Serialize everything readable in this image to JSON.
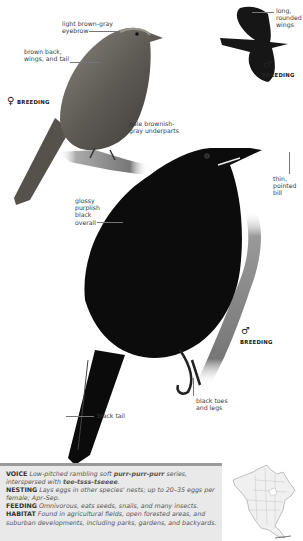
{
  "female": {
    "sex_symbol": "♀",
    "plumage": "BREEDING",
    "labels": {
      "eyebrow": "light brown-gray\neyebrow",
      "back": "brown back,\nwings, and tail",
      "underparts": "pale brownish-\ngray underparts"
    }
  },
  "flying_male": {
    "sex_symbol": "♂",
    "plumage": "BREEDING",
    "labels": {
      "wings": "long,\nrounded\nwings"
    }
  },
  "male": {
    "sex_symbol": "♂",
    "plumage": "BREEDING",
    "labels": {
      "overall": "glossy\npurplish\nblack\noverall",
      "bill": "thin,\npointed\nbill",
      "toes": "black toes\nand legs",
      "tail": "black tail"
    }
  },
  "info": {
    "voice_key": "VOICE",
    "voice_text_1": "Low-pitched rambling soft ",
    "voice_call": "purr-purr-purr",
    "voice_text_2": " series,\ninterspersed with ",
    "voice_call_2": "tee-tsss-tseeee",
    "voice_text_3": ".",
    "nesting_key": "NESTING",
    "nesting_text": "Lays eggs in other species' nests; up to 20–35 eggs per female; Apr–Sep.",
    "feeding_key": "FEEDING",
    "feeding_text": "Omnivorous, eats seeds, snails, and many insects.",
    "habitat_key": "HABITAT",
    "habitat_text": "Found in agricultural fields, open forested areas, and suburban developments, including parks, gardens, and backyards."
  },
  "map": {
    "name": "range-map-north-america"
  },
  "colors": {
    "info_bg": "#e9e9e9",
    "info_bar": "#9a9a9a",
    "label_line": "#777777"
  }
}
